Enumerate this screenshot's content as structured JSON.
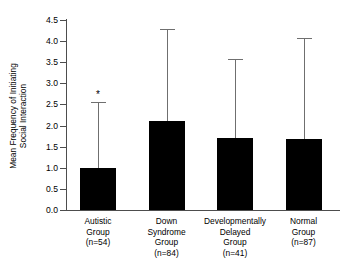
{
  "chart_data": {
    "type": "bar",
    "title": "",
    "xlabel": "",
    "ylabel": "Mean Frequency of Initiating\nSocial Interaction",
    "ylim": [
      0.0,
      4.5
    ],
    "grid": false,
    "legend": "none",
    "bar_color": "#000000",
    "error_color": "#6f6f6f",
    "axis_color": "#4d4d4d",
    "ytick_labels": [
      "0.0",
      "0.5",
      "1.0",
      "1.5",
      "2.0",
      "2.5",
      "3.0",
      "3.5",
      "4.0",
      "4.5"
    ],
    "ytick_values": [
      0.0,
      0.5,
      1.0,
      1.5,
      2.0,
      2.5,
      3.0,
      3.5,
      4.0,
      4.5
    ],
    "categories": [
      "Autistic\nGroup\n(n=54)",
      "Down\nSyndrome\nGroup\n(n=84)",
      "Developmentally\nDelayed\nGroup\n(n=41)",
      "Normal\nGroup\n(n=87)"
    ],
    "category_names": [
      "Autistic Group",
      "Down Syndrome Group",
      "Developmentally Delayed Group",
      "Normal Group"
    ],
    "sample_sizes": [
      54,
      84,
      41,
      87
    ],
    "values": [
      1.0,
      2.1,
      1.7,
      1.68
    ],
    "error_upper": [
      2.55,
      4.28,
      3.58,
      4.08
    ],
    "annotations": [
      {
        "category": "Autistic Group",
        "text": "*",
        "meaning": "significance-marker"
      }
    ]
  }
}
